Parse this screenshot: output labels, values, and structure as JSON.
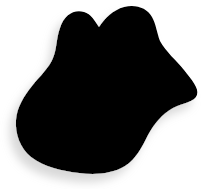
{
  "canvas": {
    "width": 214,
    "height": 189,
    "background_color": "#ffffff",
    "alt_text": "Irregular black amoeba-like blob silhouette with soft light grey drop shadow on white background"
  },
  "shape": {
    "name": "blob-silhouette",
    "kind": "freeform-blob",
    "fill_color": "#000000",
    "stroke": "none",
    "path": "M 60 28 C 64 15, 74 9, 84 12 C 91 14, 95 21, 99 27 C 105 18, 113 10, 124 7 C 136 4, 147 8, 152 17 C 156 24, 157 33, 160 41 C 166 52, 176 60, 184 70 C 192 80, 199 88, 197 95 C 195 102, 183 103, 173 108 C 162 114, 154 124, 148 135 C 142 147, 136 159, 125 166 C 112 174, 95 175, 79 173 C 62 171, 44 167, 31 157 C 20 148, 15 134, 16 120 C 17 107, 24 96, 32 86 C 40 76, 49 68, 53 58 C 57 49, 56 39, 60 28 Z"
  },
  "shadow": {
    "name": "blob-drop-shadow",
    "color": "#d6d6d6",
    "offset_x": -6,
    "offset_y": 8,
    "blur": 5,
    "opacity": 0.95
  }
}
